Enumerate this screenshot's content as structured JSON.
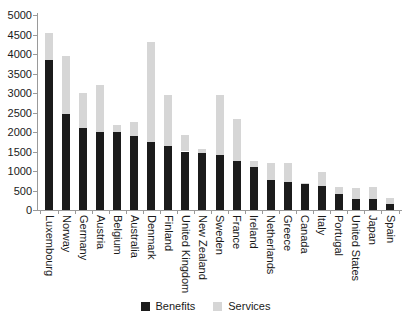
{
  "chart_data": {
    "type": "bar",
    "subtype": "stacked-vertical",
    "title": "",
    "xlabel": "",
    "ylabel": "",
    "ylim": [
      0,
      5000
    ],
    "yticks": [
      0,
      500,
      1000,
      1500,
      2000,
      2500,
      3000,
      3500,
      4000,
      4500,
      5000
    ],
    "grid": false,
    "legend_position": "bottom-center",
    "categories": [
      "Luxembourg",
      "Norway",
      "Germany",
      "Austria",
      "Belgium",
      "Australia",
      "Denmark",
      "Finland",
      "United Kingdom",
      "New Zealand",
      "Sweden",
      "France",
      "Ireland",
      "Netherlands",
      "Greece",
      "Canada",
      "Italy",
      "Portugal",
      "United States",
      "Japan",
      "Spain"
    ],
    "series": [
      {
        "name": "Benefits",
        "color": "#1b1b1b",
        "values": [
          3850,
          2450,
          2100,
          2000,
          2000,
          1900,
          1750,
          1650,
          1500,
          1450,
          1400,
          1250,
          1100,
          775,
          725,
          675,
          625,
          400,
          275,
          275,
          150
        ]
      },
      {
        "name": "Services",
        "color": "#d6d6d6",
        "values": [
          700,
          1500,
          900,
          1200,
          175,
          350,
          2550,
          1300,
          425,
          125,
          1550,
          1075,
          150,
          425,
          475,
          25,
          350,
          200,
          300,
          325,
          150
        ]
      }
    ],
    "totals": [
      4550,
      3950,
      3000,
      3200,
      2175,
      2250,
      4300,
      2950,
      1925,
      1575,
      2950,
      2325,
      1250,
      1200,
      1200,
      700,
      975,
      600,
      575,
      600,
      300
    ],
    "axis_color": "#9a9a9a",
    "text_color": "#1a1a1a"
  }
}
